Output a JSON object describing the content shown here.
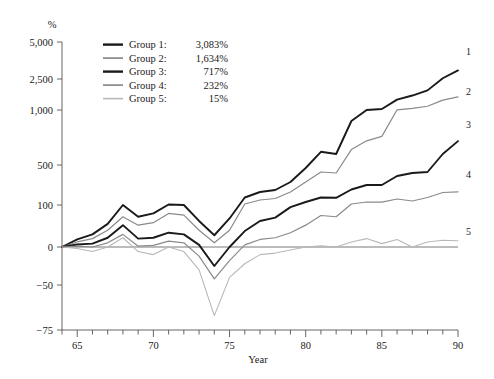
{
  "chart_data": {
    "type": "line",
    "title": "",
    "xlabel": "Year",
    "ylabel": "%",
    "unit_label": "%",
    "grid": false,
    "legend_position": "top-left",
    "x": [
      1964,
      1965,
      1966,
      1967,
      1968,
      1969,
      1970,
      1971,
      1972,
      1973,
      1974,
      1975,
      1976,
      1977,
      1978,
      1979,
      1980,
      1981,
      1982,
      1983,
      1984,
      1985,
      1986,
      1987,
      1988,
      1989,
      1990
    ],
    "x_tick_labels": [
      "65",
      "70",
      "75",
      "80",
      "85",
      "90"
    ],
    "x_tick_values": [
      1965,
      1970,
      1975,
      1980,
      1985,
      1990
    ],
    "xlim": [
      1964,
      1990
    ],
    "y_tick_labels": [
      "5,000",
      "2,500",
      "1,000",
      "500",
      "100",
      "0",
      "−50",
      "−75"
    ],
    "y_tick_values": [
      5000,
      2500,
      1000,
      500,
      100,
      0,
      -50,
      -75
    ],
    "ylim": [
      -75,
      5000
    ],
    "y_scale": "piecewise-compressed",
    "zero_line": true,
    "series": [
      {
        "name": "Group 1",
        "end_label": "1",
        "total_label": "3,083%",
        "color": "#1a1a1a",
        "width": 1.9,
        "values": [
          0,
          18,
          30,
          55,
          100,
          72,
          80,
          105,
          100,
          62,
          28,
          68,
          175,
          230,
          250,
          330,
          470,
          620,
          600,
          900,
          1000,
          1050,
          1500,
          1700,
          1950,
          2550,
          3083
        ]
      },
      {
        "name": "Group 2",
        "end_label": "2",
        "total_label": "1,634%",
        "color": "#8a8a8a",
        "width": 1.2,
        "values": [
          0,
          12,
          20,
          40,
          72,
          52,
          58,
          80,
          76,
          40,
          10,
          40,
          110,
          150,
          165,
          230,
          330,
          430,
          420,
          640,
          720,
          760,
          1010,
          1080,
          1180,
          1480,
          1634
        ]
      },
      {
        "name": "Group 3",
        "end_label": "3",
        "total_label": "717%",
        "color": "#1a1a1a",
        "width": 1.9,
        "values": [
          0,
          6,
          8,
          22,
          52,
          20,
          22,
          34,
          30,
          5,
          -25,
          0,
          38,
          62,
          70,
          95,
          130,
          175,
          172,
          255,
          300,
          300,
          390,
          420,
          430,
          600,
          717
        ]
      },
      {
        "name": "Group 4",
        "end_label": "4",
        "total_label": "232%",
        "color": "#8a8a8a",
        "width": 1.2,
        "values": [
          0,
          2,
          0,
          10,
          30,
          2,
          4,
          14,
          10,
          -12,
          -42,
          -18,
          5,
          18,
          22,
          34,
          52,
          75,
          72,
          110,
          130,
          128,
          160,
          140,
          175,
          225,
          232
        ]
      },
      {
        "name": "Group 5",
        "end_label": "5",
        "total_label": "15%",
        "color": "#b8b8b8",
        "width": 1.1,
        "values": [
          0,
          -2,
          -6,
          0,
          22,
          -6,
          -10,
          0,
          -6,
          -30,
          -67,
          -40,
          -22,
          -10,
          -8,
          -4,
          0,
          3,
          0,
          12,
          20,
          8,
          18,
          0,
          12,
          16,
          15
        ]
      }
    ]
  },
  "legend": {
    "entries": [
      {
        "label": "Group 1:",
        "value": "3,083%"
      },
      {
        "label": "Group 2:",
        "value": "1,634%"
      },
      {
        "label": "Group 3:",
        "value": "717%"
      },
      {
        "label": "Group 4:",
        "value": "232%"
      },
      {
        "label": "Group 5:",
        "value": "15%"
      }
    ]
  }
}
